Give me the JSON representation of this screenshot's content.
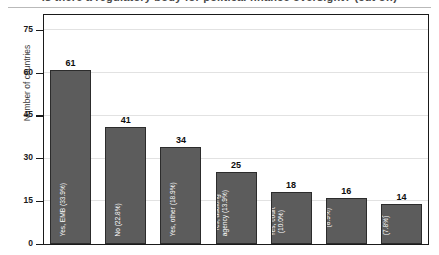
{
  "title": "Is there a regulatory body for political finance oversight? (cut off)",
  "chart_data": {
    "type": "bar",
    "title": "Is there a regulatory body for political finance oversight? (cut off)",
    "xlabel": "",
    "ylabel": "Number of countries",
    "ylim": [
      0,
      80
    ],
    "yticks": [
      "0",
      "15",
      "30",
      "45",
      "60",
      "75"
    ],
    "ytick_values": [
      0,
      15,
      30,
      45,
      60,
      75
    ],
    "grid": true,
    "legend": "none",
    "categories": [
      "Yes, EMB (33.9%)",
      "No (22.8%)",
      "Yes, other (18.9%)",
      "Yes, auditing agency (13.9%)",
      "Yes, court (10.0%)",
      "Yes, institution for this purpose (8.9%)",
      "Yes, ministry (7.8%)"
    ],
    "values": [
      61,
      41,
      34,
      25,
      18,
      16,
      14
    ],
    "value_labels": [
      "61",
      "41",
      "34",
      "25",
      "18",
      "16",
      "14"
    ],
    "bar_labels": [
      [
        "Yes, EMB (33.9%)"
      ],
      [
        "No (22.8%)"
      ],
      [
        "Yes, other (18.9%)"
      ],
      [
        "Yes, auditing",
        "agency (13.9%)"
      ],
      [
        "Yes, court",
        "(10.0%)"
      ],
      [
        "Yes,",
        "institution for",
        "this purpose",
        "(8.9%)"
      ],
      [
        "Yes,",
        "ministry",
        "(7.8%)"
      ]
    ],
    "percentages": [
      "33.9%",
      "22.8%",
      "18.9%",
      "13.9%",
      "10.0%",
      "8.9%",
      "7.8%"
    ],
    "bar_color": "#5c5c5c",
    "bar_edge_color": "#2c2c2c",
    "grid_color": "#e2e2e2",
    "frame_color": "#1a1a1a",
    "label_text_color": "#ffffff",
    "value_text_color": "#0d0d0d"
  }
}
